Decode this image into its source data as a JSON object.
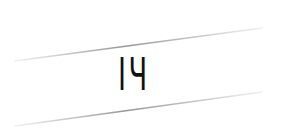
{
  "image": {
    "text": "IЧ",
    "background": "#ffffff",
    "text_color": "#111111",
    "line_color": "#9a9a9a"
  },
  "lines": [
    {
      "x1": 15,
      "y1": 61,
      "x2": 262,
      "y2": 28
    },
    {
      "x1": 15,
      "y1": 126,
      "x2": 262,
      "y2": 92
    }
  ]
}
